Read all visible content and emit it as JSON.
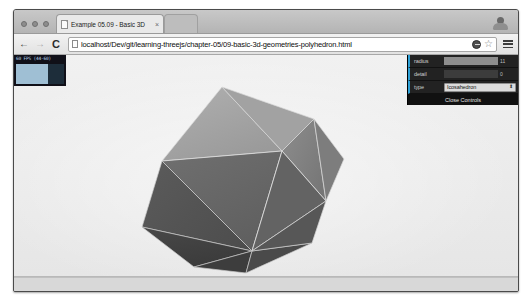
{
  "window": {
    "controls": [
      "minimize",
      "maximize",
      "close"
    ]
  },
  "tabs": [
    {
      "title": "Example 05.09 - Basic 3D",
      "close_label": "×",
      "favicon": "page-icon",
      "active": true
    },
    {
      "title": "",
      "close_label": "",
      "favicon": "",
      "active": false
    }
  ],
  "toolbar": {
    "back_label": "←",
    "forward_label": "→",
    "reload_label": "C",
    "url": "localhost/Dev/git/learning-threejs/chapter-05/09-basic-3d-geometries-polyhedron.html",
    "url_placeholder": "Search Google or type a URL",
    "star_label": "☆",
    "extension_icon": "extension-icon",
    "menu_icon": "hamburger-menu-icon"
  },
  "stats": {
    "label": "60 FPS (44-60)",
    "fps": 60,
    "fps_min": 44,
    "fps_max": 60
  },
  "control_panel": {
    "rows": [
      {
        "label": "radius",
        "type": "slider",
        "value": "11",
        "fill_pct": 100
      },
      {
        "label": "detail",
        "type": "slider",
        "value": "0",
        "fill_pct": 0
      },
      {
        "label": "type",
        "type": "select",
        "value": "Icosahedron",
        "arrow": "⬍",
        "options": [
          "Icosahedron",
          "Tetrahedron",
          "Octahedron",
          "Dodecahedron"
        ]
      }
    ],
    "close_label": "Close Controls"
  },
  "scene": {
    "background_color": "#ededed",
    "shape": "icosahedron",
    "face_colors": {
      "lightest": "#a6a6a6",
      "light": "#8f8f8f",
      "mid": "#6e6e6e",
      "dark": "#545454",
      "darkest": "#3f3f3f"
    },
    "edge_color": "#e8e8e8"
  },
  "colors": {
    "accent": "#2fa1d6",
    "chrome_bg": "#e2e2e2",
    "panel_bg": "#1a1a1a"
  }
}
